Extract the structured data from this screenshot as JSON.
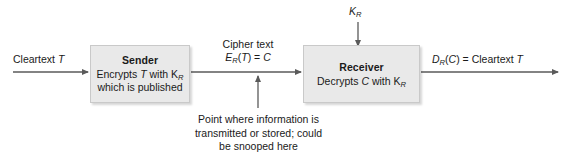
{
  "diagram": {
    "background_color": "#ffffff",
    "box_fill_color": "#e9e9e9",
    "box_border_color": "#c9c9c9",
    "line_color": "#5a5a5a",
    "text_color": "#1a1a1a"
  },
  "nodes": {
    "sender": {
      "title": "Sender",
      "line1": "Encrypts T with K",
      "line1_sub": "R",
      "line2": "which is published"
    },
    "receiver": {
      "title": "Receiver",
      "line1": "Decrypts C with K",
      "line1_sub": "R"
    }
  },
  "labels": {
    "cleartext_in": "Cleartext T",
    "cipher_name": "Cipher text",
    "cipher_formula_lead": "E",
    "cipher_formula_sub": "R",
    "cipher_formula_rest": "(T) = C",
    "key_lead": "K",
    "key_sub": "R",
    "decrypt_lead": "D",
    "decrypt_sub": "R",
    "decrypt_rest": "(C) = Cleartext T",
    "snoop_note_line1": "Point where information is",
    "snoop_note_line2": "transmitted or stored; could",
    "snoop_note_line3": "be snooped here"
  }
}
